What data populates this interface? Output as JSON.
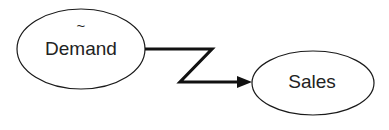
{
  "diagram": {
    "background_color": "#ffffff",
    "stroke_color": "#1a1a1a",
    "link_color": "#111111",
    "nodes": [
      {
        "id": "demand",
        "label": "Demand",
        "modifier": "~",
        "shape": "ellipse",
        "cx": 81,
        "cy": 49,
        "rx": 64,
        "ry": 40,
        "label_x": 81,
        "label_y": 50,
        "modifier_x": 81,
        "modifier_y": 27
      },
      {
        "id": "sales",
        "label": "Sales",
        "modifier": "",
        "shape": "ellipse",
        "cx": 313,
        "cy": 83,
        "rx": 61,
        "ry": 32,
        "label_x": 312,
        "label_y": 83,
        "modifier_x": 0,
        "modifier_y": 0
      }
    ],
    "links": [
      {
        "id": "demand-to-sales",
        "from": "demand",
        "to": "sales",
        "style": "zigzag",
        "arrow": "filled-triangle",
        "points": "145,49 212,49 180,82 244,82",
        "arrowhead_points": "252,82 237,76 237,88"
      }
    ]
  }
}
